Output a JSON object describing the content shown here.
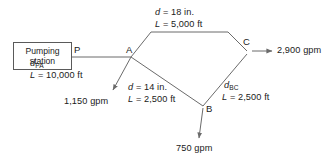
{
  "diagram": {
    "line_color": "#6b6b6b",
    "text_color": "#1a1a1a",
    "pump_station": {
      "line1": "Pumping",
      "line2": "station"
    },
    "nodes": [
      {
        "id": "P",
        "label": "P"
      },
      {
        "id": "A",
        "label": "A"
      },
      {
        "id": "B",
        "label": "B"
      },
      {
        "id": "C",
        "label": "C"
      }
    ],
    "pipes": [
      {
        "id": "PA",
        "diameter_var": "d",
        "diameter_sub": "PA",
        "diameter_value": "",
        "length_var": "L",
        "length_text": "= 10,000 ft"
      },
      {
        "id": "AC",
        "diameter_var": "d",
        "diameter_sub": "",
        "diameter_value": "= 18 in.",
        "length_var": "L",
        "length_text": "= 5,000 ft"
      },
      {
        "id": "AB",
        "diameter_var": "d",
        "diameter_sub": "",
        "diameter_value": "= 14 in.",
        "length_var": "L",
        "length_text": "= 2,500 ft"
      },
      {
        "id": "BC",
        "diameter_var": "d",
        "diameter_sub": "BC",
        "diameter_value": "",
        "length_var": "L",
        "length_text": "= 2,500 ft"
      }
    ],
    "demands": [
      {
        "at": "A",
        "value": "1,150 gpm"
      },
      {
        "at": "B",
        "value": "750 gpm"
      },
      {
        "at": "C",
        "value": "2,900 gpm"
      }
    ]
  }
}
